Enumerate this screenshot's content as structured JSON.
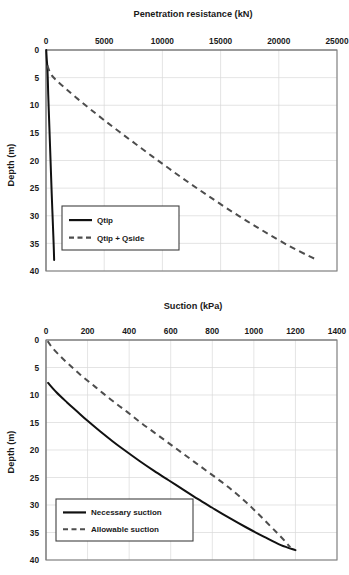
{
  "figure": {
    "panels": [
      "penetration-resistance",
      "suction"
    ]
  },
  "chart_data": [
    {
      "type": "line",
      "id": "penetration-resistance",
      "title": "Penetration resistance (kN)",
      "xlabel": "Penetration resistance (kN)",
      "ylabel": "Depth (m)",
      "x_axis_position": "top",
      "y_axis_inverted": true,
      "xlim": [
        0,
        25000
      ],
      "ylim": [
        0,
        40
      ],
      "xticks": [
        0,
        5000,
        10000,
        15000,
        20000,
        25000
      ],
      "xtick_labels": [
        "0",
        "5000",
        "10000",
        "15000",
        "20000",
        "25000"
      ],
      "yticks": [
        0,
        5,
        10,
        15,
        20,
        25,
        30,
        35,
        40
      ],
      "ytick_labels": [
        "0",
        "5",
        "10",
        "15",
        "20",
        "25",
        "30",
        "35",
        "40"
      ],
      "grid": true,
      "legend_position": "lower-left-inside",
      "series": [
        {
          "name": "Qtip",
          "style": "solid",
          "color": "#111111",
          "points": [
            [
              20,
              0
            ],
            [
              60,
              1.5
            ],
            [
              110,
              3
            ],
            [
              150,
              5
            ],
            [
              190,
              8
            ],
            [
              240,
              11
            ],
            [
              290,
              14
            ],
            [
              340,
              17
            ],
            [
              390,
              20
            ],
            [
              440,
              23
            ],
            [
              490,
              26
            ],
            [
              545,
              29
            ],
            [
              600,
              32
            ],
            [
              655,
              35
            ],
            [
              700,
              38
            ]
          ]
        },
        {
          "name": "Qtip + Qside",
          "style": "dashed",
          "color": "#4d4d4d",
          "points": [
            [
              120,
              2.8
            ],
            [
              400,
              4.3
            ],
            [
              900,
              5.5
            ],
            [
              1700,
              7
            ],
            [
              2700,
              8.8
            ],
            [
              3800,
              10.7
            ],
            [
              5000,
              12.7
            ],
            [
              6300,
              14.8
            ],
            [
              7700,
              17
            ],
            [
              9100,
              19.2
            ],
            [
              10600,
              21.5
            ],
            [
              12200,
              23.9
            ],
            [
              13800,
              26.2
            ],
            [
              15500,
              28.6
            ],
            [
              17300,
              31
            ],
            [
              19100,
              33.3
            ],
            [
              21000,
              35.6
            ],
            [
              22500,
              37.2
            ],
            [
              23200,
              37.9
            ]
          ]
        }
      ]
    },
    {
      "type": "line",
      "id": "suction",
      "title": "Suction (kPa)",
      "xlabel": "Suction (kPa)",
      "ylabel": "Depth (m)",
      "x_axis_position": "top",
      "y_axis_inverted": true,
      "xlim": [
        0,
        1400
      ],
      "ylim": [
        0,
        40
      ],
      "xticks": [
        0,
        200,
        400,
        600,
        800,
        1000,
        1200,
        1400
      ],
      "xtick_labels": [
        "0",
        "200",
        "400",
        "600",
        "800",
        "1000",
        "1200",
        "1400"
      ],
      "yticks": [
        0,
        5,
        10,
        15,
        20,
        25,
        30,
        35,
        40
      ],
      "ytick_labels": [
        "0",
        "5",
        "10",
        "15",
        "20",
        "25",
        "30",
        "35",
        "40"
      ],
      "grid": true,
      "legend_position": "lower-left-inside",
      "series": [
        {
          "name": "Necessary suction",
          "style": "solid",
          "color": "#111111",
          "points": [
            [
              10,
              7.8
            ],
            [
              50,
              9.5
            ],
            [
              100,
              11.3
            ],
            [
              150,
              13.0
            ],
            [
              200,
              14.7
            ],
            [
              260,
              16.6
            ],
            [
              320,
              18.4
            ],
            [
              380,
              20.1
            ],
            [
              450,
              22.0
            ],
            [
              520,
              23.8
            ],
            [
              590,
              25.5
            ],
            [
              660,
              27.2
            ],
            [
              730,
              28.9
            ],
            [
              800,
              30.5
            ],
            [
              880,
              32.3
            ],
            [
              960,
              34.0
            ],
            [
              1050,
              35.8
            ],
            [
              1130,
              37.3
            ],
            [
              1200,
              38.2
            ]
          ]
        },
        {
          "name": "Allowable suction",
          "style": "dashed",
          "color": "#4d4d4d",
          "points": [
            [
              8,
              0.2
            ],
            [
              30,
              1.4
            ],
            [
              70,
              3.0
            ],
            [
              115,
              4.6
            ],
            [
              165,
              6.3
            ],
            [
              220,
              8.0
            ],
            [
              275,
              9.7
            ],
            [
              335,
              11.5
            ],
            [
              395,
              13.2
            ],
            [
              455,
              15.0
            ],
            [
              520,
              16.8
            ],
            [
              585,
              18.6
            ],
            [
              650,
              20.4
            ],
            [
              715,
              22.2
            ],
            [
              780,
              24.0
            ],
            [
              845,
              25.8
            ],
            [
              905,
              27.6
            ],
            [
              960,
              29.4
            ],
            [
              1010,
              31.2
            ],
            [
              1060,
              33.1
            ],
            [
              1110,
              35.0
            ],
            [
              1150,
              36.6
            ],
            [
              1175,
              37.7
            ]
          ]
        }
      ]
    }
  ]
}
